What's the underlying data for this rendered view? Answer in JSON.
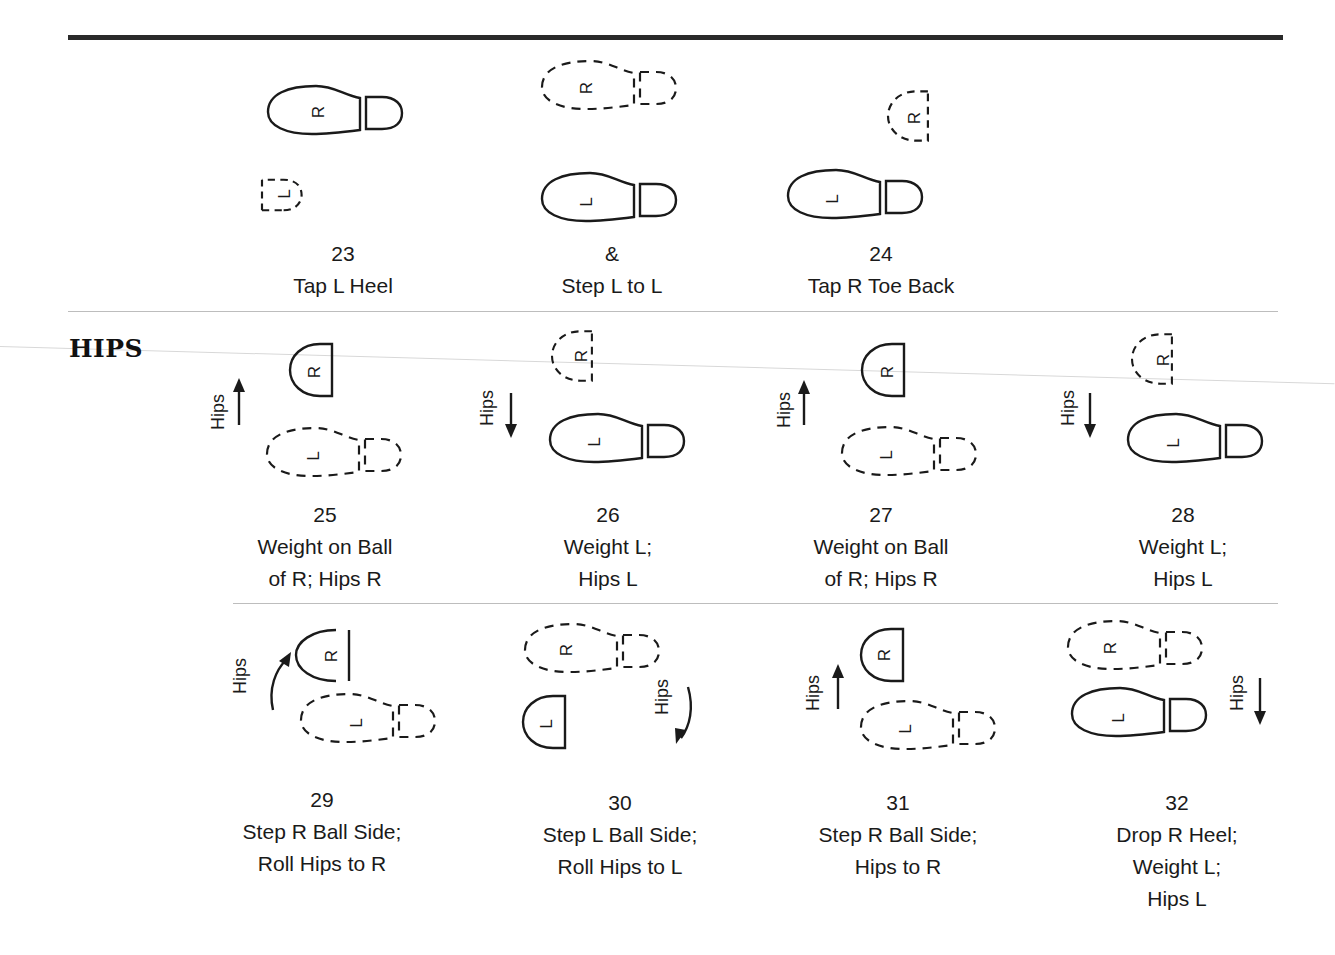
{
  "section": {
    "title": "HIPS"
  },
  "steps": [
    {
      "count": "23",
      "lines": [
        "Tap L Heel"
      ]
    },
    {
      "count": "&",
      "lines": [
        "Step L to L"
      ]
    },
    {
      "count": "24",
      "lines": [
        "Tap R Toe Back"
      ]
    },
    {
      "count": "25",
      "lines": [
        "Weight on Ball",
        "of R; Hips R"
      ]
    },
    {
      "count": "26",
      "lines": [
        "Weight L;",
        "Hips L"
      ]
    },
    {
      "count": "27",
      "lines": [
        "Weight on Ball",
        "of R; Hips R"
      ]
    },
    {
      "count": "28",
      "lines": [
        "Weight L;",
        "Hips L"
      ]
    },
    {
      "count": "29",
      "lines": [
        "Step R Ball Side;",
        "Roll Hips to R"
      ]
    },
    {
      "count": "30",
      "lines": [
        "Step L Ball Side;",
        "Roll Hips to L"
      ]
    },
    {
      "count": "31",
      "lines": [
        "Step R Ball Side;",
        "Hips to R"
      ]
    },
    {
      "count": "32",
      "lines": [
        "Drop R Heel;",
        "Weight L;",
        "Hips L"
      ]
    }
  ],
  "labels": {
    "hips": "Hips",
    "left_foot": "L",
    "right_foot": "R"
  }
}
